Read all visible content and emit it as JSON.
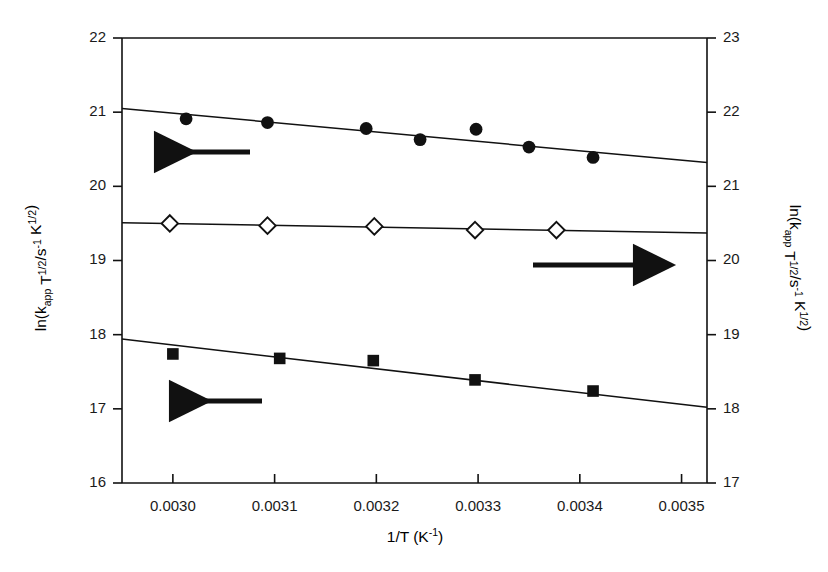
{
  "figure": {
    "background": "#ffffff",
    "ink": "#111111",
    "plot_box": {
      "left": 122,
      "right": 707,
      "top": 38,
      "bottom": 483
    }
  },
  "axes": {
    "x": {
      "label_parts": {
        "base": "1/T (K",
        "sup": "-1",
        "tail": ")"
      },
      "label_plain": "1/T (K^-1)",
      "min": 0.00295,
      "max": 0.003525,
      "ticks": [
        0.003,
        0.0031,
        0.0032,
        0.0033,
        0.0034,
        0.0035
      ],
      "tick_labels": [
        "0.0030",
        "0.0031",
        "0.0032",
        "0.0033",
        "0.0034",
        "0.0035"
      ]
    },
    "y_left": {
      "label_parts": {
        "a": "ln(k",
        "sub1": "app",
        "b": " T",
        "sup1": "1/2",
        "c": "/s",
        "sup2": "-1",
        "d": " K",
        "sup3": "1/2",
        "e": ")"
      },
      "label_plain": "ln(k_app T^1/2/s^-1 K^1/2)",
      "min": 16,
      "max": 22,
      "ticks": [
        16,
        17,
        18,
        19,
        20,
        21,
        22
      ],
      "tick_labels": [
        "16",
        "17",
        "18",
        "19",
        "20",
        "21",
        "22"
      ]
    },
    "y_right": {
      "label_parts": {
        "a": "ln(k",
        "sub1": "app",
        "b": " T",
        "sup1": "1/2",
        "c": "/s",
        "sup2": "-1",
        "d": " K",
        "sup3": "1/2",
        "e": ")"
      },
      "label_plain": "ln(k_app T^1/2/s^-1 K^1/2)",
      "min": 17,
      "max": 23,
      "ticks": [
        17,
        18,
        19,
        20,
        21,
        22,
        23
      ],
      "tick_labels": [
        "17",
        "18",
        "19",
        "20",
        "21",
        "22",
        "23"
      ]
    }
  },
  "chart_data": {
    "type": "scatter",
    "title": "",
    "xlabel": "1/T (K^-1)",
    "ylabel": "ln(k_app T^1/2/s^-1 K^1/2)",
    "xlim": [
      0.00295,
      0.003525
    ],
    "ylim_left": [
      16,
      22
    ],
    "ylim_right": [
      17,
      23
    ],
    "grid": false,
    "legend": "none",
    "series": [
      {
        "name": "filled-circles",
        "marker": "circle-filled",
        "axis": "left",
        "color": "#111111",
        "x": [
          0.003013,
          0.003093,
          0.00319,
          0.003243,
          0.003298,
          0.00335,
          0.003413
        ],
        "y": [
          20.91,
          20.86,
          20.78,
          20.63,
          20.77,
          20.53,
          20.39
        ],
        "fit_line": {
          "x": [
            0.00295,
            0.003525
          ],
          "y": [
            21.05,
            20.32
          ]
        }
      },
      {
        "name": "open-diamonds",
        "marker": "diamond-open",
        "axis": "right",
        "color": "#111111",
        "x": [
          0.002997,
          0.003093,
          0.003198,
          0.003297,
          0.003377
        ],
        "y": [
          20.5,
          20.47,
          20.46,
          20.41,
          20.41
        ],
        "fit_line": {
          "x": [
            0.00295,
            0.003525
          ],
          "y": [
            20.51,
            20.37
          ]
        }
      },
      {
        "name": "filled-squares",
        "marker": "square-filled",
        "axis": "left",
        "color": "#111111",
        "x": [
          0.003,
          0.003105,
          0.003197,
          0.003297,
          0.003413
        ],
        "y": [
          17.74,
          17.68,
          17.65,
          17.39,
          17.24
        ],
        "fit_line": {
          "x": [
            0.00295,
            0.003525
          ],
          "y": [
            17.94,
            17.02
          ]
        }
      }
    ],
    "annotations": [
      {
        "name": "arrow-to-left-axis-top",
        "type": "arrow",
        "direction": "left",
        "x_px": [
          250,
          155
        ],
        "y_px": 152
      },
      {
        "name": "arrow-to-right-axis",
        "type": "arrow",
        "direction": "right",
        "x_px": [
          533,
          634
        ],
        "y_px": 265
      },
      {
        "name": "arrow-to-left-axis-bottom",
        "type": "arrow",
        "direction": "left",
        "x_px": [
          262,
          170
        ],
        "y_px": 401
      }
    ]
  }
}
